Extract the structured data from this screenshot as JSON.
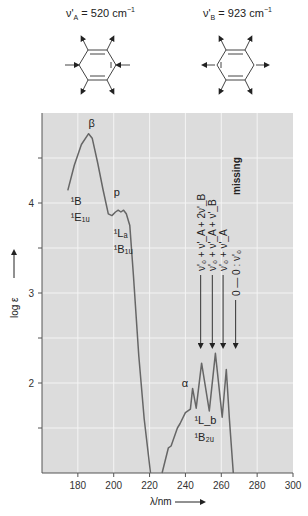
{
  "header": {
    "mode_a": {
      "symbol": "ν'",
      "sub": "A",
      "value": "= 520 cm",
      "exp": "−1"
    },
    "mode_b": {
      "symbol": "ν'",
      "sub": "B",
      "value": "= 923 cm",
      "exp": "−1"
    }
  },
  "chart_data": {
    "type": "line",
    "title": "",
    "xlabel": "λ/nm",
    "ylabel": "log ε",
    "xlim": [
      160,
      300
    ],
    "ylim": [
      1.0,
      5.0
    ],
    "grid": true,
    "x_ticks": [
      180,
      200,
      220,
      240,
      260,
      280,
      300
    ],
    "y_ticks": [
      2,
      3,
      4
    ],
    "y_minor_ticks": [
      1.5,
      2.5,
      3.5,
      4.5
    ],
    "series": [
      {
        "name": "benzene absorption",
        "segments": [
          {
            "x": [
              174.4,
              178,
              182,
              186,
              188,
              191,
              194,
              197,
              199,
              201,
              202.5,
              204,
              205.5,
              207,
              209,
              211,
              214,
              217,
              220.5
            ],
            "y": [
              4.14,
              4.42,
              4.65,
              4.77,
              4.72,
              4.45,
              4.15,
              3.88,
              3.86,
              3.9,
              3.92,
              3.9,
              3.92,
              3.88,
              3.75,
              3.2,
              2.3,
              1.6,
              1.0
            ]
          },
          {
            "x": [
              227,
              230.5,
              232,
              235.5,
              237,
              240,
              242.8,
              244,
              246,
              249,
              253.3,
              256.7,
              260.5,
              262.8,
              264.5,
              266.7
            ],
            "y": [
              1.0,
              1.28,
              1.3,
              1.5,
              1.55,
              1.67,
              1.71,
              1.94,
              1.72,
              2.22,
              1.69,
              2.33,
              1.62,
              2.15,
              1.6,
              1.0
            ]
          }
        ]
      }
    ],
    "annotations": [
      {
        "text": "β",
        "x": 186,
        "y": 4.85
      },
      {
        "text": "¹B",
        "x": 176,
        "y": 3.98
      },
      {
        "text": "¹E₁ᵤ",
        "x": 176,
        "y": 3.8
      },
      {
        "text": "p",
        "x": 200,
        "y": 4.08
      },
      {
        "text": "¹Lₐ",
        "x": 200,
        "y": 3.62
      },
      {
        "text": "¹B₁ᵤ",
        "x": 200,
        "y": 3.44
      },
      {
        "text": "α",
        "x": 238,
        "y": 1.96
      },
      {
        "text": "¹L_b",
        "x": 245,
        "y": 1.55
      },
      {
        "text": "¹B₂ᵤ",
        "x": 245,
        "y": 1.36
      }
    ],
    "vibronic_arrows": [
      {
        "label": "ν'₀ + ν'_A + 2ν'_B",
        "x": 248.5
      },
      {
        "label": "ν'₀ + ν'_A + ν'_B",
        "x": 255
      },
      {
        "label": "ν'₀ + ν'_A",
        "x": 261
      },
      {
        "label": "0 — 0 : ν'₀",
        "x": 268,
        "note": "missing"
      }
    ],
    "missing_label": "missing"
  }
}
